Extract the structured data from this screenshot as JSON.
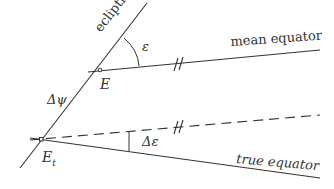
{
  "diagram": {
    "type": "geometric-figure",
    "colors": {
      "line": "#333333",
      "background": "#ffffff"
    },
    "labels": {
      "ecliptic": "ecliptic",
      "mean_equator": "mean equator",
      "true_equator": "true equator",
      "epsilon": "ε",
      "delta_psi": "Δψ",
      "delta_epsilon": "Δε",
      "point_E": "E",
      "point_Et": "E",
      "point_Et_subscript": "t"
    },
    "lines": [
      {
        "name": "ecliptic",
        "style": "solid",
        "from": [
          20,
          168
        ],
        "to": [
          147,
          3
        ]
      },
      {
        "name": "mean equator",
        "style": "solid",
        "from": [
          88,
          72
        ],
        "to": [
          320,
          50
        ]
      },
      {
        "name": "parallel to mean equator",
        "style": "dashed",
        "from": [
          30,
          137
        ],
        "to": [
          320,
          115
        ]
      },
      {
        "name": "true equator",
        "style": "solid",
        "from": [
          30,
          139
        ],
        "to": [
          320,
          178
        ]
      }
    ],
    "points": [
      {
        "name": "E",
        "at": [
          100,
          70
        ]
      },
      {
        "name": "E_t",
        "at": [
          41,
          139
        ]
      }
    ],
    "angles": [
      {
        "name": "ε",
        "between": [
          "ecliptic",
          "mean equator"
        ],
        "vertex": "E"
      },
      {
        "name": "Δε",
        "between": [
          "dashed parallel",
          "true equator"
        ],
        "vertex": "E_t"
      }
    ],
    "parallel_marks": "//"
  }
}
